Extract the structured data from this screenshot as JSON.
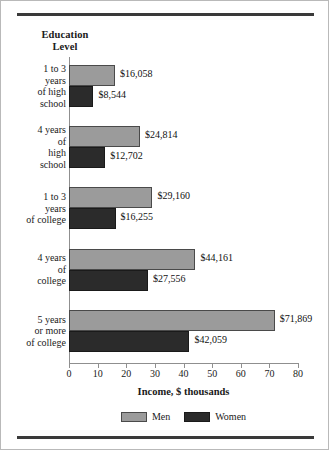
{
  "figure": {
    "y_axis_header_line1": "Education",
    "y_axis_header_line2": "Level"
  },
  "chart_data": {
    "type": "bar",
    "orientation": "horizontal",
    "title": "",
    "xlabel": "Income, $ thousands",
    "ylabel": "Education Level",
    "xlim": [
      0,
      80
    ],
    "xticks": [
      0,
      10,
      20,
      30,
      40,
      50,
      60,
      70,
      80
    ],
    "xtick_labels": [
      "0",
      "10",
      "20",
      "30",
      "40",
      "50",
      "60",
      "70",
      "80"
    ],
    "grid": false,
    "legend_position": "bottom-center",
    "categories": [
      "1 to 3 years of high school",
      "4 years of high school",
      "1 to 3 years of college",
      "4 years of college",
      "5 years or more of college"
    ],
    "category_label_lines": [
      [
        "1 to 3",
        "years",
        "of high",
        "school"
      ],
      [
        "4 years",
        "of",
        "high",
        "school"
      ],
      [
        "1 to 3",
        "years",
        "of college"
      ],
      [
        "4 years",
        "of",
        "college"
      ],
      [
        "5 years",
        "or more",
        "of college"
      ]
    ],
    "series": [
      {
        "name": "Men",
        "color": "#9b9b9b",
        "values": [
          16.058,
          24.814,
          29.16,
          44.161,
          71.869
        ],
        "value_labels": [
          "$16,058",
          "$24,814",
          "$29,160",
          "$44,161",
          "$71,869"
        ]
      },
      {
        "name": "Women",
        "color": "#2b2b2b",
        "values": [
          8.544,
          12.702,
          16.255,
          27.556,
          42.059
        ],
        "value_labels": [
          "$8,544",
          "$12,702",
          "$16,255",
          "$27,556",
          "$42,059"
        ]
      }
    ],
    "legend": [
      {
        "label": "Men",
        "color": "#9b9b9b"
      },
      {
        "label": "Women",
        "color": "#2b2b2b"
      }
    ]
  }
}
